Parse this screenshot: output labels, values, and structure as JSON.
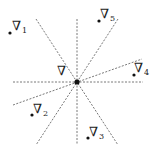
{
  "diagram": {
    "center": {
      "x": 77,
      "y": 82,
      "label": "∇"
    },
    "lines": [
      {
        "name": "horizontal",
        "x1": 13,
        "y1": 82,
        "x2": 143,
        "y2": 82
      },
      {
        "name": "vertical",
        "x1": 77,
        "y1": 19,
        "x2": 77,
        "y2": 145
      },
      {
        "name": "diag-down",
        "x1": 36,
        "y1": 19,
        "x2": 118,
        "y2": 145
      },
      {
        "name": "diag-up",
        "x1": 118,
        "y1": 19,
        "x2": 36,
        "y2": 145
      },
      {
        "name": "shallow",
        "x1": 13,
        "y1": 105,
        "x2": 142,
        "y2": 59
      }
    ],
    "points": [
      {
        "id": "1",
        "symbol": "∇",
        "sub": "1",
        "x": 10,
        "y": 33,
        "lx": 12,
        "ly": 19
      },
      {
        "id": "2",
        "symbol": "∇",
        "sub": "2",
        "x": 32,
        "y": 115,
        "lx": 33,
        "ly": 102
      },
      {
        "id": "3",
        "symbol": "∇",
        "sub": "3",
        "x": 88,
        "y": 138,
        "lx": 89,
        "ly": 125
      },
      {
        "id": "4",
        "symbol": "∇",
        "sub": "4",
        "x": 134,
        "y": 75,
        "lx": 134,
        "ly": 61
      },
      {
        "id": "5",
        "symbol": "∇",
        "sub": "5",
        "x": 99,
        "y": 21,
        "lx": 100,
        "ly": 7
      }
    ],
    "colors": {
      "line": "#555555",
      "dot": "#111111",
      "text": "#222222"
    }
  }
}
